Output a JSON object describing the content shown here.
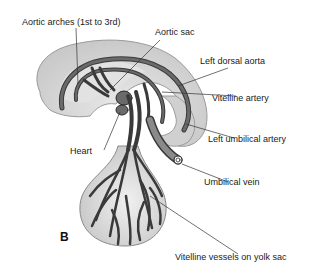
{
  "diagram": {
    "panel_label": "B",
    "labels": {
      "aortic_arches": "Aortic arches (1st to 3rd)",
      "aortic_sac": "Aortic sac",
      "left_dorsal_aorta": "Left dorsal aorta",
      "vitelline_artery": "Vitelline artery",
      "heart": "Heart",
      "left_umbilical_artery": "Left umbilical artery",
      "umbilical_vein": "Umbilical vein",
      "vitelline_vessels": "Vitelline vessels on yolk sac"
    },
    "colors": {
      "embryo_fill": "#d4d4d4",
      "embryo_inner": "#e6e6e6",
      "vessel": "#5a5a5a",
      "vessel_outline": "#2a2a2a",
      "leader_line": "#333333"
    }
  }
}
